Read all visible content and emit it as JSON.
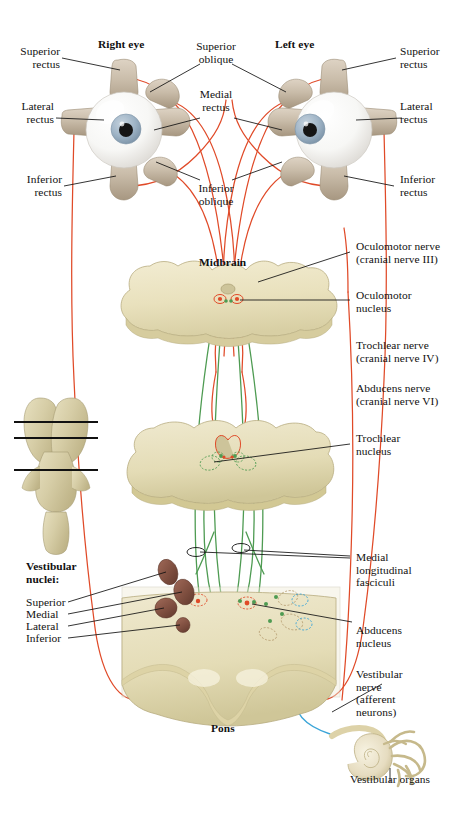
{
  "figure": {
    "background_color": "#ffffff"
  },
  "colors": {
    "oculomotor_nerve": "#E04A28",
    "internuclear_green": "#4E9B52",
    "vestibular_blue": "#3BA5D8",
    "brainstem_tissue": "#EDE7C4",
    "brainstem_tissue_dark": "#D9D0A2",
    "vestibular_nuclei": "#8C5A4A",
    "leader_line": "#1a1a1a",
    "eye_sclera": "#F6F6F4",
    "eye_iris": "#A9BCCB",
    "muscle": "#C8BBA9"
  },
  "eyes": {
    "right_eye_label": "Right eye",
    "left_eye_label": "Left eye"
  },
  "labels_left": [
    {
      "id": "superior-rectus-left",
      "text": "Superior\nrectus"
    },
    {
      "id": "lateral-rectus-left",
      "text": "Lateral\nrectus"
    },
    {
      "id": "inferior-rectus-left",
      "text": "Inferior\nrectus"
    }
  ],
  "labels_right": [
    {
      "id": "superior-rectus-right",
      "text": "Superior\nrectus"
    },
    {
      "id": "lateral-rectus-right",
      "text": "Lateral\nrectus"
    },
    {
      "id": "inferior-rectus-right",
      "text": "Inferior\nrectus"
    }
  ],
  "labels_center": [
    {
      "id": "superior-oblique",
      "text": "Superior\noblique"
    },
    {
      "id": "medial-rectus",
      "text": "Medial\nrectus"
    },
    {
      "id": "inferior-oblique",
      "text": "Inferior\noblique"
    }
  ],
  "labels_right_column": [
    {
      "id": "oculomotor-nerve",
      "text": "Oculomotor nerve\n(cranial nerve III)"
    },
    {
      "id": "oculomotor-nucleus",
      "text": "Oculomotor\nnucleus"
    },
    {
      "id": "trochlear-nerve",
      "text": "Trochlear nerve\n(cranial nerve IV)"
    },
    {
      "id": "abducens-nerve",
      "text": "Abducens nerve\n(cranial nerve VI)"
    },
    {
      "id": "trochlear-nucleus",
      "text": "Trochlear\nnucleus"
    },
    {
      "id": "medial-longitudinal-fasciculi",
      "text": "Medial\nlongitudinal\nfasciculi"
    },
    {
      "id": "abducens-nucleus",
      "text": "Abducens\nnucleus"
    },
    {
      "id": "vestibular-nerve",
      "text": "Vestibular\nnerve\n(afferent\nneurons)"
    },
    {
      "id": "vestibular-organs",
      "text": "Vestibular organs"
    }
  ],
  "vestibular_nuclei": {
    "heading": "Vestibular\nnuclei:",
    "items": [
      {
        "id": "vn-superior",
        "text": "Superior"
      },
      {
        "id": "vn-medial",
        "text": "Medial"
      },
      {
        "id": "vn-lateral",
        "text": "Lateral"
      },
      {
        "id": "vn-inferior",
        "text": "Inferior"
      }
    ]
  },
  "structures": {
    "midbrain": "Midbrain",
    "pons": "Pons"
  }
}
